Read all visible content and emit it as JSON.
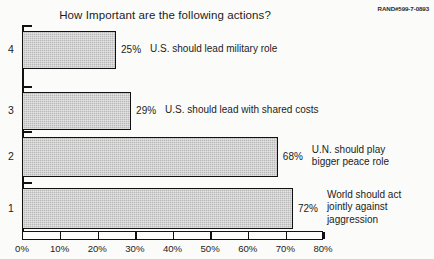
{
  "chart_data": {
    "type": "bar",
    "orientation": "horizontal",
    "title": "How Important are the following actions?",
    "xlabel": "",
    "ylabel": "",
    "xlim": [
      0,
      80
    ],
    "xticks": [
      "0%",
      "10%",
      "20%",
      "30%",
      "40%",
      "50%",
      "60%",
      "70%",
      "80%"
    ],
    "xtick_values": [
      0,
      10,
      20,
      30,
      40,
      50,
      60,
      70,
      80
    ],
    "grid": false,
    "legend": false,
    "categories": [
      "1",
      "2",
      "3",
      "4"
    ],
    "bars": [
      {
        "category": "4",
        "value": 25,
        "value_label": "25%",
        "description": "U.S. should lead military role"
      },
      {
        "category": "3",
        "value": 29,
        "value_label": "29%",
        "description": "U.S. should lead with shared costs"
      },
      {
        "category": "2",
        "value": 68,
        "value_label": "68%",
        "description": "U.N. should play\nbigger peace role"
      },
      {
        "category": "1",
        "value": 72,
        "value_label": "72%",
        "description": "World should act\njointly against\njaggression"
      }
    ],
    "bar_fill_color": "#b9b9b9",
    "bar_edge_color": "#111111"
  },
  "annotations": {
    "rand_id": "RAND#599-7-0893"
  }
}
